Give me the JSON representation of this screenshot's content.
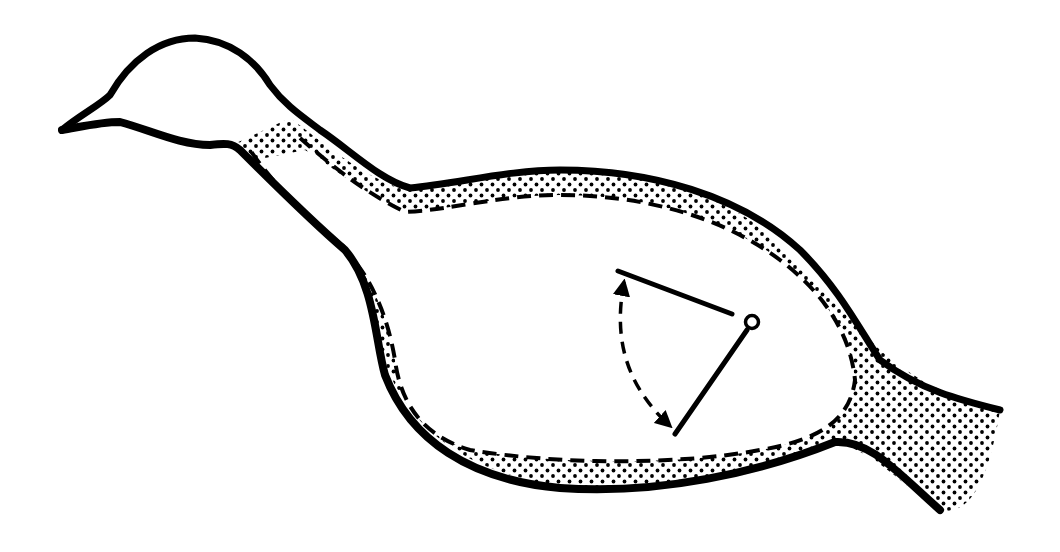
{
  "diagram": {
    "colors": {
      "ink": "#000000",
      "background": "#ffffff"
    },
    "elements": [
      {
        "id": "outer-outline",
        "kind": "solid-thick-line"
      },
      {
        "id": "stipple-layer",
        "kind": "dotted-fill"
      },
      {
        "id": "inner-boundary",
        "kind": "dashed-line"
      },
      {
        "id": "pivot",
        "kind": "small-circle"
      },
      {
        "id": "arm-upper",
        "kind": "solid-line"
      },
      {
        "id": "arm-lower",
        "kind": "solid-line"
      },
      {
        "id": "rotation-arc",
        "kind": "dashed-double-arrow"
      }
    ]
  }
}
